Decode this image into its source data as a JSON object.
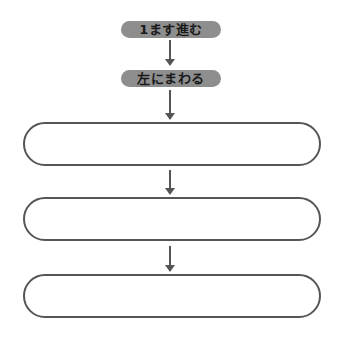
{
  "flowchart": {
    "steps": [
      {
        "label": "1ます進む",
        "type": "filled"
      },
      {
        "label": "左にまわる",
        "type": "filled"
      },
      {
        "label": "",
        "type": "blank"
      },
      {
        "label": "",
        "type": "blank"
      },
      {
        "label": "",
        "type": "blank"
      }
    ],
    "colors": {
      "filled_pill": "#8e8e8e",
      "filled_text": "#1a1a1a",
      "outline": "#555555",
      "background": "#ffffff"
    }
  }
}
